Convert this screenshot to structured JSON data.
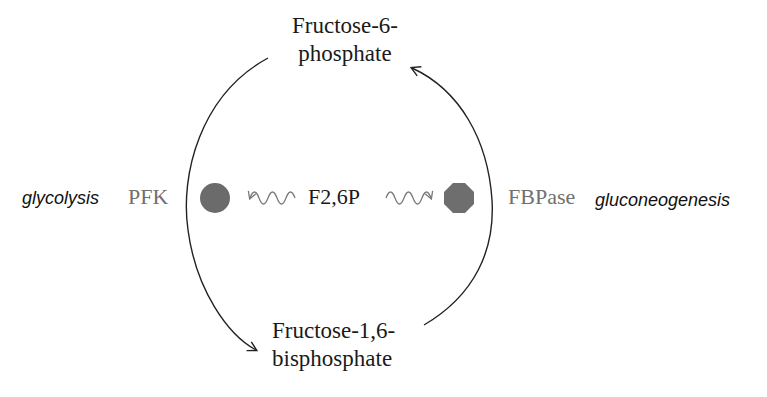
{
  "diagram": {
    "type": "regulatory-cycle",
    "metabolites": {
      "top": {
        "line1": "Fructose-6-",
        "line2": "phosphate"
      },
      "bottom": {
        "line1": "Fructose-1,6-",
        "line2": "bisphosphate"
      }
    },
    "effector": {
      "label": "F2,6P"
    },
    "enzymes": {
      "left": {
        "label": "PFK",
        "shape": "circle",
        "color": "#6b6b6b",
        "regulation": "activated"
      },
      "right": {
        "label": "FBPase",
        "shape": "octagon",
        "color": "#6e6e6e",
        "regulation": "inhibited"
      }
    },
    "pathways": {
      "left": {
        "label": "glycolysis"
      },
      "right": {
        "label": "gluconeogenesis"
      }
    },
    "arrows": [
      {
        "from": "top",
        "to": "bottom",
        "side": "left",
        "via": "PFK"
      },
      {
        "from": "bottom",
        "to": "top",
        "side": "right",
        "via": "FBPase"
      }
    ],
    "colors": {
      "line": "#222222",
      "wave": "#7a7a7a",
      "enzyme_text": "#707070"
    }
  }
}
